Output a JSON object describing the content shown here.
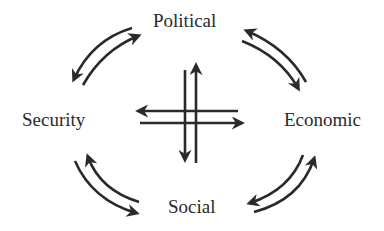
{
  "diagram": {
    "nodes": [
      {
        "id": "political",
        "label": "Political",
        "position": "top"
      },
      {
        "id": "economic",
        "label": "Economic",
        "position": "right"
      },
      {
        "id": "social",
        "label": "Social",
        "position": "bottom"
      },
      {
        "id": "security",
        "label": "Security",
        "position": "left"
      }
    ],
    "edges": [
      {
        "between": [
          "political",
          "security"
        ],
        "type": "bidirectional-curved-arrows"
      },
      {
        "between": [
          "political",
          "economic"
        ],
        "type": "bidirectional-curved-arrows"
      },
      {
        "between": [
          "economic",
          "social"
        ],
        "type": "bidirectional-curved-arrows"
      },
      {
        "between": [
          "social",
          "security"
        ],
        "type": "bidirectional-curved-arrows"
      }
    ],
    "center": {
      "type": "crossing-arrows",
      "directions": [
        "up",
        "down",
        "left",
        "right"
      ]
    },
    "colors": {
      "stroke": "#2a2a2a",
      "text": "#2a2a2a",
      "background": "#ffffff"
    }
  }
}
